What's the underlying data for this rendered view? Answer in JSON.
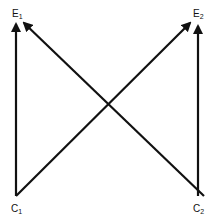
{
  "diagram": {
    "nodes": [
      {
        "id": "E1",
        "base": "E",
        "sub": "1",
        "x": 12,
        "y": 9
      },
      {
        "id": "E2",
        "base": "E",
        "sub": "2",
        "x": 193,
        "y": 9
      },
      {
        "id": "C1",
        "base": "C",
        "sub": "1",
        "x": 11,
        "y": 204
      },
      {
        "id": "C2",
        "base": "C",
        "sub": "2",
        "x": 193,
        "y": 204
      }
    ],
    "edges": [
      {
        "from": "C1",
        "to": "E1",
        "type": "arrow"
      },
      {
        "from": "C2",
        "to": "E1",
        "type": "arrow"
      },
      {
        "from": "C1",
        "to": "E2",
        "type": "arrow"
      },
      {
        "from": "C2",
        "to": "E2",
        "type": "arrow"
      }
    ],
    "colors": {
      "line": "#111111",
      "background": "#ffffff"
    }
  }
}
